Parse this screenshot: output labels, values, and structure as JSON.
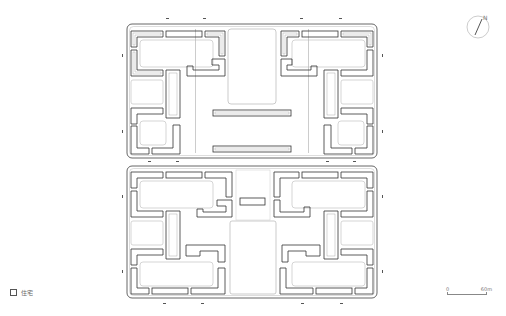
{
  "figure": {
    "type": "architectural site plan",
    "blocks": [
      {
        "name": "north-block",
        "x": 127,
        "y": 24,
        "w": 250,
        "h": 134
      },
      {
        "name": "south-block",
        "x": 127,
        "y": 166,
        "w": 250,
        "h": 132
      }
    ]
  },
  "legend": {
    "items": [
      {
        "label": "住宅",
        "swatch_color": "#ffffff",
        "border_color": "#555555"
      }
    ]
  },
  "scale_bar": {
    "start_label": "0",
    "end_label": "60m"
  },
  "north_arrow": {
    "label": "N"
  },
  "colors": {
    "building_outline": "#333333",
    "courtyard_outline": "#bbbbbb",
    "block_outline": "#555555",
    "background": "#ffffff"
  }
}
